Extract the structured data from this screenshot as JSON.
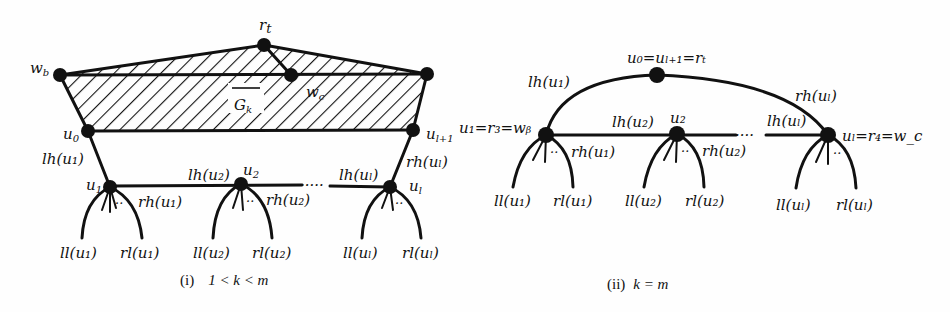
{
  "figure": {
    "panel_i": {
      "caption_prefix": "(i)",
      "caption_condition": "1 < k < m",
      "region_label": "G",
      "region_label_sub": "k",
      "nodes": {
        "r_t": "r",
        "r_t_sub": "t",
        "w_b": "w",
        "w_b_sub": "b",
        "w_c": "w",
        "w_c_sub": "c",
        "u_0": "u",
        "u_0_sub": "0",
        "u_l1": "u",
        "u_l1_sub": "l+1",
        "u_1": "u",
        "u_1_sub": "1",
        "u_2": "u",
        "u_2_sub": "2",
        "u_l": "u",
        "u_l_sub": "l"
      },
      "edge_labels": {
        "lh_u1": "lh(u₁)",
        "rh_u1": "rh(u₁)",
        "lh_u2": "lh(u₂)",
        "rh_u2": "rh(u₂)",
        "lh_ul": "lh(uₗ)",
        "rh_ul": "rh(uₗ)"
      },
      "leaf_labels": {
        "ll_u1": "ll(u₁)",
        "rl_u1": "rl(u₁)",
        "ll_u2": "ll(u₂)",
        "rl_u2": "rl(u₂)",
        "ll_ul": "ll(uₗ)",
        "rl_ul": "rl(uₗ)"
      },
      "ellipsis": "·····",
      "fan_dots": "··"
    },
    "panel_ii": {
      "caption_prefix": "(ii)",
      "caption_condition": "k = m",
      "nodes": {
        "top": "u₀=uₗ₊₁=rₜ",
        "left": "u₁=r₃=wᵦ",
        "left_display": "u₁ = r₃ = w_b",
        "mid": "u₂",
        "right": "uₗ=r₄=w_c"
      },
      "edge_labels": {
        "lh_u1": "lh(u₁)",
        "rh_u1": "rh(u₁)",
        "lh_u2": "lh(u₂)",
        "rh_u2": "rh(u₂)",
        "lh_ul": "lh(uₗ)",
        "rh_ul": "rh(uₗ)"
      },
      "leaf_labels": {
        "ll_u1": "ll(u₁)",
        "rl_u1": "rl(u₁)",
        "ll_u2": "ll(u₂)",
        "rl_u2": "rl(u₂)",
        "ll_ul": "ll(uₗ)",
        "rl_ul": "rl(uₗ)"
      },
      "ellipsis": "····",
      "fan_dots": "··"
    },
    "colors": {
      "ink": "#111111",
      "background": "#fefefe"
    }
  }
}
